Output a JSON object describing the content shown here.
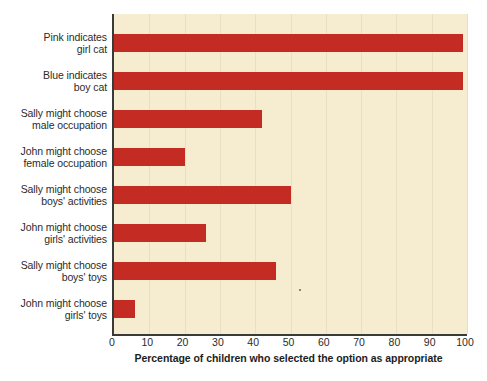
{
  "chart_data": {
    "type": "bar",
    "orientation": "horizontal",
    "title": "",
    "xlabel": "Percentage of children who selected the option as appropriate",
    "ylabel": "",
    "xlim": [
      0,
      100
    ],
    "xticks": [
      0,
      10,
      20,
      30,
      40,
      50,
      60,
      70,
      80,
      90,
      100
    ],
    "grid": true,
    "legend": "none",
    "bar_color": "#c42b22",
    "plot_background": "#f6ecd0",
    "categories": [
      "Pink indicates girl cat",
      "Blue indicates boy cat",
      "Sally might choose male occupation",
      "John might choose female occupation",
      "Sally might choose boys' activities",
      "John might choose girls' activities",
      "Sally might choose boys' toys",
      "John might choose girls' toys"
    ],
    "category_lines": [
      [
        "Pink indicates",
        "girl cat"
      ],
      [
        "Blue indicates",
        "boy cat"
      ],
      [
        "Sally might choose",
        "male occupation"
      ],
      [
        "John might choose",
        "female occupation"
      ],
      [
        "Sally might choose",
        "boys' activities"
      ],
      [
        "John might choose",
        "girls' activities"
      ],
      [
        "Sally might choose",
        "boys' toys"
      ],
      [
        "John might choose",
        "girls' toys"
      ]
    ],
    "values": [
      99,
      99,
      42,
      20,
      50,
      26,
      46,
      6
    ]
  },
  "axis": {
    "tick_labels": [
      "0",
      "10",
      "20",
      "30",
      "40",
      "50",
      "60",
      "70",
      "80",
      "90",
      "100"
    ],
    "title": "Percentage of children who selected the option as appropriate"
  }
}
